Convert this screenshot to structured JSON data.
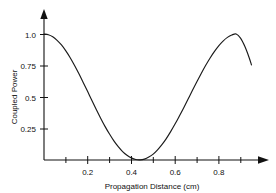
{
  "chart_data": {
    "type": "line",
    "title": "",
    "xlabel": "Propagation Distance (cm)",
    "ylabel": "Coupled Power",
    "xlim": [
      0,
      0.98
    ],
    "ylim": [
      0,
      1.08
    ],
    "grid": false,
    "legend": null,
    "x_ticks": [
      0.2,
      0.4,
      0.6,
      0.8
    ],
    "x_tick_labels": [
      "0.2",
      "0.4",
      "0.6",
      "0.8"
    ],
    "x_minor_ticks": [
      0.1,
      0.3,
      0.5,
      0.7,
      0.9
    ],
    "y_ticks": [
      0.25,
      0.5,
      0.75,
      1.0
    ],
    "y_tick_labels": [
      "0.25",
      "0.5",
      "0.75",
      "1.0"
    ],
    "series": [
      {
        "name": "Coupled Power",
        "color": "#1a1a1a",
        "x": [
          0.0,
          0.02,
          0.04,
          0.06,
          0.08,
          0.1,
          0.12,
          0.14,
          0.16,
          0.18,
          0.2,
          0.22,
          0.24,
          0.26,
          0.28,
          0.3,
          0.32,
          0.34,
          0.36,
          0.38,
          0.4,
          0.42,
          0.44,
          0.46,
          0.48,
          0.5,
          0.52,
          0.54,
          0.56,
          0.58,
          0.6,
          0.62,
          0.64,
          0.66,
          0.68,
          0.7,
          0.72,
          0.74,
          0.76,
          0.78,
          0.8,
          0.82,
          0.84,
          0.86,
          0.88,
          0.9,
          0.92,
          0.94,
          0.95
        ],
        "y": [
          1.0,
          0.994,
          0.978,
          0.95,
          0.913,
          0.866,
          0.812,
          0.75,
          0.684,
          0.614,
          0.543,
          0.47,
          0.399,
          0.33,
          0.265,
          0.206,
          0.152,
          0.106,
          0.067,
          0.038,
          0.017,
          0.004,
          0.001,
          0.007,
          0.023,
          0.047,
          0.081,
          0.122,
          0.17,
          0.225,
          0.285,
          0.349,
          0.415,
          0.484,
          0.553,
          0.621,
          0.687,
          0.75,
          0.808,
          0.86,
          0.906,
          0.944,
          0.973,
          0.992,
          1.0,
          0.967,
          0.9,
          0.81,
          0.755
        ]
      }
    ],
    "annotations": {
      "start_value": "1.0",
      "minimum_x": "0.42",
      "minimum_value": "0",
      "second_peak_x": "0.84",
      "second_peak_value": "1.0",
      "end_value": "0.75"
    }
  },
  "axes": {
    "x_axis_name": "propagation-distance-axis",
    "y_axis_name": "coupled-power-axis"
  }
}
